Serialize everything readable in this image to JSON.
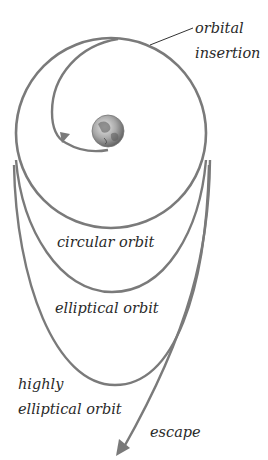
{
  "diagram": {
    "labels": {
      "orbital_insertion_line1": "orbital",
      "orbital_insertion_line2": "insertion",
      "circular_orbit": "circular orbit",
      "elliptical_orbit": "elliptical orbit",
      "highly_elliptical_line1": "highly",
      "highly_elliptical_line2": "elliptical orbit",
      "escape": "escape"
    },
    "icons": {
      "earth": "earth-globe-icon",
      "insertion_arrow": "arrowhead-icon",
      "escape_arrow": "arrowhead-icon"
    },
    "colors": {
      "stroke": "#7a7a7a",
      "leader_line": "#333333",
      "text": "#2a2a2a",
      "earth_light": "#d8d8d8",
      "earth_dark": "#6a6a6a",
      "background": "#ffffff"
    }
  }
}
